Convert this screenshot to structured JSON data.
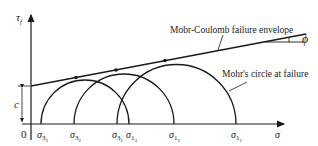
{
  "diagram": {
    "axes": {
      "y_label": "τ",
      "y_label_sub": "f",
      "x_label": "σ",
      "origin_label": "0"
    },
    "annotations": {
      "envelope": "Mobr-Coulomb failure envelope",
      "circle": "Mohr's circle at failure",
      "angle": "ϕ",
      "cohesion": "c"
    },
    "x_ticks": [
      {
        "main": "σ",
        "sub": "3",
        "subsub": "3"
      },
      {
        "main": "σ",
        "sub": "3",
        "subsub": "2"
      },
      {
        "main": "σ",
        "sub": "3",
        "subsub": "1"
      },
      {
        "main": "σ",
        "sub": "1",
        "subsub": "3"
      },
      {
        "main": "σ",
        "sub": "1",
        "subsub": "2"
      },
      {
        "main": "σ",
        "sub": "1",
        "subsub": "1"
      }
    ],
    "circles": [
      {
        "name": "circle-3",
        "sigma3_x": 41,
        "sigma1_x": 129
      },
      {
        "name": "circle-2",
        "sigma3_x": 74,
        "sigma1_x": 174
      },
      {
        "name": "circle-1",
        "sigma3_x": 117,
        "sigma1_x": 236
      }
    ],
    "colors": {
      "stroke": "#1a1a1a",
      "background": "#ffffff"
    }
  }
}
